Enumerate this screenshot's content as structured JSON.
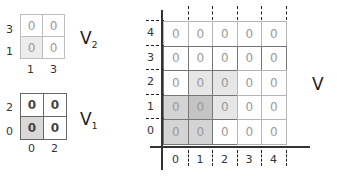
{
  "v2": {
    "name": "V",
    "subscript": "2",
    "row_labels": [
      "3",
      "1"
    ],
    "col_labels": [
      "1",
      "3"
    ],
    "cells": [
      [
        "0",
        "0"
      ],
      [
        "0",
        "0"
      ]
    ],
    "shaded": [
      [
        false,
        false
      ],
      [
        true,
        false
      ]
    ],
    "border_color": "#bdbdbd"
  },
  "v1": {
    "name": "V",
    "subscript": "1",
    "row_labels": [
      "2",
      "0"
    ],
    "col_labels": [
      "0",
      "2"
    ],
    "cells": [
      [
        "0",
        "0"
      ],
      [
        "0",
        "0"
      ]
    ],
    "shaded": [
      [
        false,
        false
      ],
      [
        true,
        false
      ]
    ],
    "border_color": "#666666"
  },
  "v": {
    "name": "V",
    "row_labels": [
      "4",
      "3",
      "2",
      "1",
      "0"
    ],
    "col_labels": [
      "0",
      "1",
      "2",
      "3",
      "4"
    ],
    "cells": [
      [
        "0",
        "0",
        "0",
        "0",
        "0"
      ],
      [
        "0",
        "0",
        "0",
        "0",
        "0"
      ],
      [
        "0",
        "0",
        "0",
        "0",
        "0"
      ],
      [
        "0",
        "0",
        "0",
        "0",
        "0"
      ],
      [
        "0",
        "0",
        "0",
        "0",
        "0"
      ]
    ],
    "shading": [
      [
        "#ffffff",
        "#ffffff",
        "#ffffff",
        "#ffffff",
        "#ffffff"
      ],
      [
        "#ffffff",
        "#ffffff",
        "#ffffff",
        "#ffffff",
        "#ffffff"
      ],
      [
        "#ffffff",
        "#e6e6e6",
        "#e6e6e6",
        "#ffffff",
        "#ffffff"
      ],
      [
        "#d4d4d4",
        "#c4c4c4",
        "#e6e6e6",
        "#ffffff",
        "#ffffff"
      ],
      [
        "#d4d4d4",
        "#d4d4d4",
        "#ffffff",
        "#ffffff",
        "#ffffff"
      ]
    ]
  }
}
